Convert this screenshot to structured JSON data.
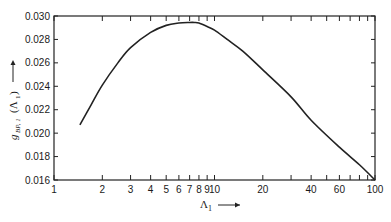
{
  "chart_data": {
    "type": "line",
    "title": "",
    "xlabel": "Λ1 →",
    "ylabel": "g_BP,1 (Λ1) →",
    "xscale": "log",
    "xlim": [
      1,
      100
    ],
    "ylim": [
      0.016,
      0.03
    ],
    "grid": false,
    "legend": null,
    "x_tick_labels": [
      "1",
      "2",
      "3",
      "4",
      "5",
      "6",
      "7",
      "8",
      "9",
      "10",
      "20",
      "40",
      "60",
      "100"
    ],
    "x_tick_values": [
      1,
      2,
      3,
      4,
      5,
      6,
      7,
      8,
      9,
      10,
      20,
      40,
      60,
      100
    ],
    "x_minor_ticks": [
      30,
      50,
      70,
      80,
      90
    ],
    "y_tick_labels": [
      "0.016",
      "0.018",
      "0.020",
      "0.022",
      "0.024",
      "0.026",
      "0.028",
      "0.030"
    ],
    "y_tick_values": [
      0.016,
      0.018,
      0.02,
      0.022,
      0.024,
      0.026,
      0.028,
      0.03
    ],
    "series": [
      {
        "name": "g_BP,1(Λ1)",
        "x": [
          1.45,
          1.7,
          2,
          2.5,
          3,
          4,
          5,
          6,
          7,
          7.5,
          8,
          9,
          10,
          12,
          15,
          20,
          30,
          40,
          60,
          80,
          100
        ],
        "y": [
          0.0207,
          0.0224,
          0.0241,
          0.026,
          0.0273,
          0.0286,
          0.0292,
          0.0294,
          0.02945,
          0.02945,
          0.0294,
          0.0291,
          0.0288,
          0.028,
          0.027,
          0.0254,
          0.0231,
          0.0211,
          0.0188,
          0.0173,
          0.016
        ]
      }
    ]
  },
  "axes": {
    "x_title_main": "Λ",
    "x_title_sub": "1",
    "y_title_main": "g",
    "y_title_sub": "BP, 1",
    "y_title_tail": " (Λ",
    "y_title_tail_sub": "1",
    "y_title_close": ")"
  }
}
